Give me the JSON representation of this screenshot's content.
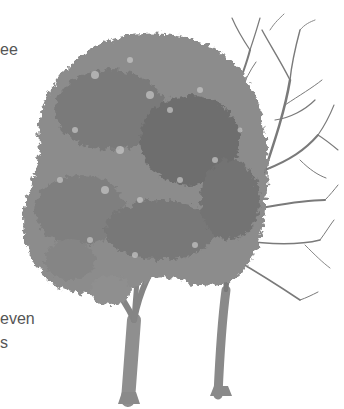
{
  "illustration": {
    "subject": "Two trees: one in full leaf, one with bare branches",
    "style": "grayscale botanical illustration",
    "colors": {
      "background": "#ffffff",
      "canopy_dark": "#6e6e6e",
      "canopy_mid": "#8c8c8c",
      "canopy_light": "#b4b4b4",
      "branch": "#7a7a7a",
      "trunk": "#8a8a8a",
      "text": "#555555"
    }
  },
  "text_fragments": [
    {
      "text": "ee",
      "x": 0,
      "y": 42
    },
    {
      "text": "even",
      "x": 0,
      "y": 311
    },
    {
      "text": "s",
      "x": 0,
      "y": 335
    }
  ]
}
